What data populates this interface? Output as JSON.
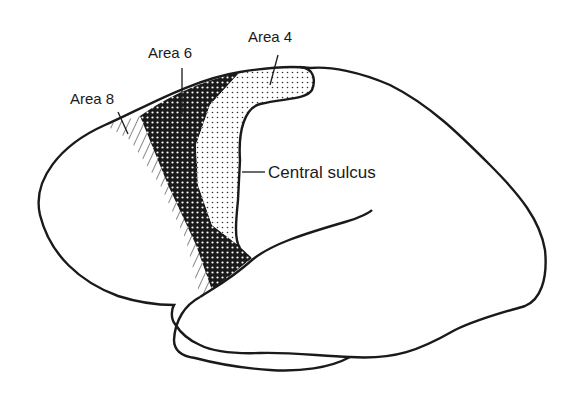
{
  "figure": {
    "labels": {
      "area8": "Area 8",
      "area6": "Area 6",
      "area4": "Area 4",
      "central_sulcus": "Central sulcus"
    },
    "regions": [
      {
        "id": "area8",
        "pattern": "diagonal-hatch"
      },
      {
        "id": "area6",
        "pattern": "dense-dark-dots"
      },
      {
        "id": "area4",
        "pattern": "light-stipple"
      }
    ],
    "colors": {
      "outline": "#1a1a1a",
      "background": "#ffffff"
    }
  }
}
